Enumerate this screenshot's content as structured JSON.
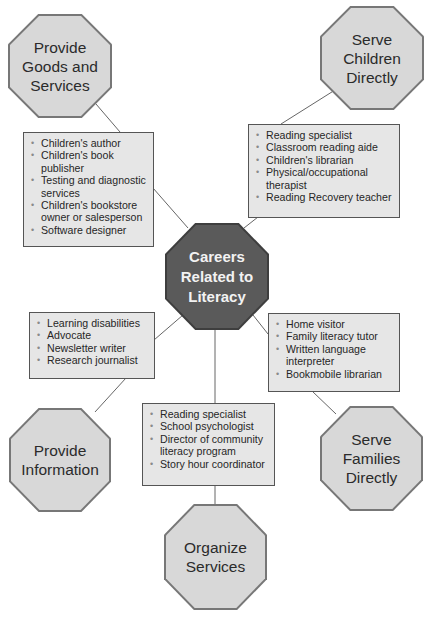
{
  "diagram": {
    "center": {
      "label": "Careers\nRelated to\nLiteracy"
    },
    "categories": [
      {
        "id": "goods",
        "label": "Provide\nGoods and\nServices",
        "items": [
          "Children's author",
          "Children's book publisher",
          "Testing and diagnostic services",
          "Children's bookstore owner or salesperson",
          "Software designer"
        ]
      },
      {
        "id": "children",
        "label": "Serve\nChildren\nDirectly",
        "items": [
          "Reading specialist",
          "Classroom reading aide",
          "Children's librarian",
          "Physical/occupational therapist",
          "Reading Recovery teacher"
        ]
      },
      {
        "id": "information",
        "label": "Provide\nInformation",
        "items": [
          "Learning disabilities",
          "Advocate",
          "Newsletter writer",
          "Research journalist"
        ]
      },
      {
        "id": "families",
        "label": "Serve\nFamilies\nDirectly",
        "items": [
          "Home visitor",
          "Family literacy tutor",
          "Written language interpreter",
          "Bookmobile librarian"
        ]
      },
      {
        "id": "organize",
        "label": "Organize\nServices",
        "items": [
          "Reading specialist",
          "School psychologist",
          "Director of community literacy program",
          "Story hour coordinator"
        ]
      }
    ],
    "bullet": "•",
    "colors": {
      "center_fill": "#5a5a5a",
      "category_fill": "#d8d8d8",
      "box_fill": "#e6e6e6",
      "line": "#666666"
    }
  }
}
